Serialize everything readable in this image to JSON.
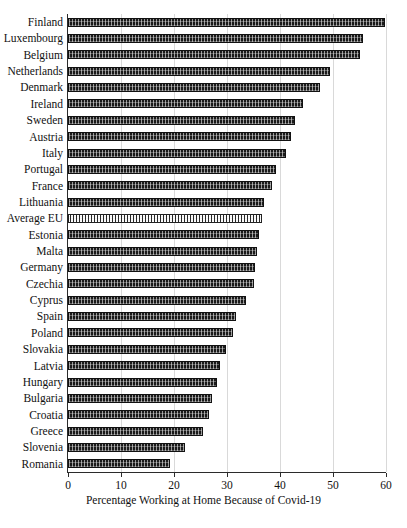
{
  "chart_data": {
    "type": "bar",
    "orientation": "horizontal",
    "title": "",
    "xlabel": "Percentage Working at Home Because of Covid-19",
    "ylabel": "",
    "xlim": [
      0,
      60
    ],
    "xticks": [
      0,
      10,
      20,
      30,
      40,
      50,
      60
    ],
    "grid": "vertical",
    "legend": "none",
    "highlight_category": "Average EU",
    "categories": [
      "Finland",
      "Luxembourg",
      "Belgium",
      "Netherlands",
      "Denmark",
      "Ireland",
      "Sweden",
      "Austria",
      "Italy",
      "Portugal",
      "France",
      "Lithuania",
      "Average EU",
      "Estonia",
      "Malta",
      "Germany",
      "Czechia",
      "Cyprus",
      "Spain",
      "Poland",
      "Slovakia",
      "Latvia",
      "Hungary",
      "Bulgaria",
      "Croatia",
      "Greece",
      "Slovenia",
      "Romania"
    ],
    "values": [
      59.9,
      55.6,
      55.1,
      49.5,
      47.5,
      44.4,
      42.8,
      42.0,
      41.1,
      39.3,
      38.5,
      37.0,
      36.6,
      36.0,
      35.6,
      35.3,
      35.1,
      33.6,
      31.7,
      31.2,
      29.9,
      28.6,
      28.1,
      27.2,
      26.6,
      25.4,
      22.1,
      19.3
    ]
  },
  "axis": {
    "x_title": "Percentage Working at Home Because of Covid-19",
    "tick_labels": [
      "0",
      "10",
      "20",
      "30",
      "40",
      "50",
      "60"
    ]
  },
  "colors": {
    "bar_fill": "#1a1a1a",
    "bar_highlight_fill": "#9a9a9a",
    "axis": "#2b2b2b",
    "gridline": "#d9d9d9",
    "background": "#ffffff",
    "text": "#111111"
  }
}
